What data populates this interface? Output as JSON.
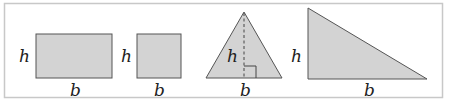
{
  "diagram": {
    "frame": {
      "stroke": "#c8c8c8"
    },
    "fill_color": "#d3d3d3",
    "stroke_color": "#555555",
    "shapes": [
      {
        "name": "rectangle",
        "height_label": "h",
        "base_label": "b"
      },
      {
        "name": "square",
        "height_label": "h",
        "base_label": "b"
      },
      {
        "name": "isosceles-triangle",
        "height_label": "h",
        "base_label": "b"
      },
      {
        "name": "right-triangle",
        "height_label": "h",
        "base_label": "b"
      }
    ]
  }
}
